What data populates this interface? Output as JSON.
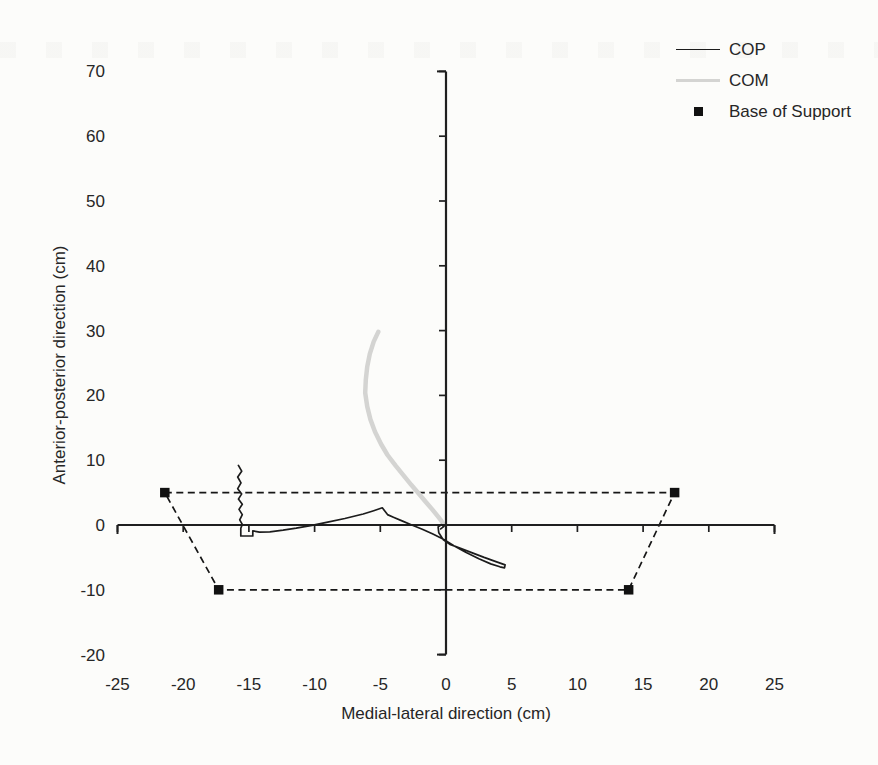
{
  "figure": {
    "background": "#fcfcfa",
    "text_color": "#262626"
  },
  "legend": {
    "items": [
      {
        "label": "COP",
        "swatch": "line",
        "color": "#1c1c1c"
      },
      {
        "label": "COM",
        "swatch": "line",
        "color": "#d4d4d2"
      },
      {
        "label": "Base of Support",
        "swatch": "square-marker",
        "color": "#111111"
      }
    ]
  },
  "chart_data": {
    "type": "line",
    "title": "",
    "xlabel": "Medial-lateral direction (cm)",
    "ylabel": "Anterior-posterior direction (cm)",
    "xlim": [
      -25,
      25
    ],
    "ylim": [
      -20,
      70
    ],
    "xticks": [
      -25,
      -20,
      -15,
      -10,
      -5,
      0,
      5,
      10,
      15,
      20,
      25
    ],
    "yticks": [
      -20,
      -10,
      0,
      10,
      20,
      30,
      40,
      50,
      60,
      70
    ],
    "grid": false,
    "legend_position": "top-right",
    "axis_color": "#1f1f1f",
    "series": [
      {
        "name": "Base of Support",
        "type": "polygon",
        "line_style": "dashed",
        "marker": "square",
        "color": "#161616",
        "points": [
          [
            -21.4,
            5
          ],
          [
            17.4,
            5
          ],
          [
            13.9,
            -10
          ],
          [
            -17.3,
            -10
          ]
        ]
      },
      {
        "name": "COM",
        "type": "line",
        "color": "#d4d4d2",
        "width": 4.5,
        "points": [
          [
            -5.15,
            29.8
          ],
          [
            -5.5,
            28.3
          ],
          [
            -5.8,
            26.4
          ],
          [
            -6.0,
            24.4
          ],
          [
            -6.1,
            22.4
          ],
          [
            -6.15,
            20.4
          ],
          [
            -6.0,
            18.3
          ],
          [
            -5.75,
            16.3
          ],
          [
            -5.4,
            14.4
          ],
          [
            -4.95,
            12.5
          ],
          [
            -4.45,
            10.8
          ],
          [
            -3.85,
            9.2
          ],
          [
            -3.25,
            7.7
          ],
          [
            -2.65,
            6.2
          ],
          [
            -2.05,
            4.8
          ],
          [
            -1.55,
            3.6
          ],
          [
            -1.05,
            2.4
          ],
          [
            -0.65,
            1.4
          ],
          [
            -0.35,
            0.65
          ],
          [
            -0.2,
            0.1
          ]
        ]
      },
      {
        "name": "COP",
        "type": "line",
        "color": "#1c1c1c",
        "width": 1.7,
        "points": [
          [
            -15.8,
            9.2
          ],
          [
            -15.55,
            8.3
          ],
          [
            -15.85,
            7.4
          ],
          [
            -15.6,
            6.5
          ],
          [
            -15.85,
            5.6
          ],
          [
            -15.55,
            4.8
          ],
          [
            -15.8,
            4.0
          ],
          [
            -15.5,
            3.2
          ],
          [
            -15.75,
            2.4
          ],
          [
            -15.5,
            1.6
          ],
          [
            -15.7,
            0.8
          ],
          [
            -15.5,
            0.1
          ],
          [
            -15.62,
            -0.5
          ],
          [
            -15.62,
            -1.7
          ],
          [
            -14.7,
            -1.7
          ],
          [
            -14.7,
            -0.9
          ],
          [
            -14.2,
            -1.1
          ],
          [
            -13.4,
            -1.05
          ],
          [
            -12.4,
            -0.8
          ],
          [
            -11.4,
            -0.5
          ],
          [
            -10.2,
            -0.05
          ],
          [
            -9.0,
            0.45
          ],
          [
            -7.7,
            1.0
          ],
          [
            -6.3,
            1.7
          ],
          [
            -5.5,
            2.2
          ],
          [
            -4.85,
            2.65
          ],
          [
            -4.45,
            1.6
          ],
          [
            -4.0,
            1.2
          ],
          [
            -3.3,
            0.6
          ],
          [
            -2.6,
            0.0
          ],
          [
            -1.8,
            -0.65
          ],
          [
            -1.0,
            -1.4
          ],
          [
            -0.2,
            -2.2
          ],
          [
            0.6,
            -3.2
          ],
          [
            1.5,
            -4.2
          ],
          [
            2.5,
            -5.2
          ],
          [
            3.4,
            -6.0
          ],
          [
            4.1,
            -6.45
          ],
          [
            4.45,
            -6.6
          ],
          [
            4.5,
            -6.15
          ],
          [
            3.8,
            -5.65
          ],
          [
            2.9,
            -5.0
          ],
          [
            2.0,
            -4.3
          ],
          [
            1.1,
            -3.6
          ],
          [
            0.3,
            -3.0
          ],
          [
            -0.2,
            -2.3
          ],
          [
            -0.55,
            -1.2
          ],
          [
            -0.6,
            -0.3
          ],
          [
            -0.35,
            0.05
          ],
          [
            -0.15,
            -0.2
          ],
          [
            -0.4,
            -0.6
          ]
        ]
      }
    ]
  }
}
